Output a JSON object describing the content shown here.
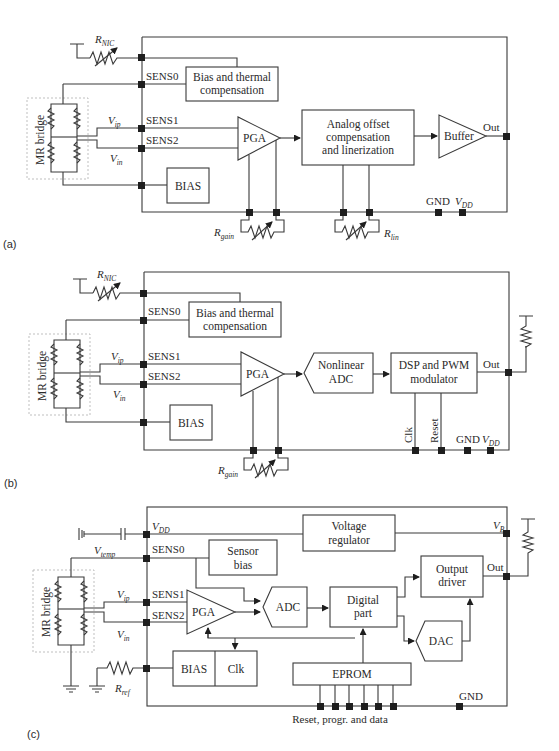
{
  "panels": {
    "a": {
      "caption": "(a)",
      "pins": {
        "sens0": "SENS0",
        "sens1": "SENS1",
        "sens2": "SENS2",
        "gnd": "GND",
        "vdd_main": "V",
        "vdd_sub": "DD",
        "out": "Out"
      },
      "labels": {
        "rnic_main": "R",
        "rnic_sub": "NIC",
        "vip_main": "V",
        "vip_sub": "ip",
        "vin_main": "V",
        "vin_sub": "in",
        "rgain_main": "R",
        "rgain_sub": "gain",
        "rlin_main": "R",
        "rlin_sub": "lin"
      },
      "blocks": {
        "mr_bridge": "MR bridge",
        "bias_thermal_1": "Bias and thermal",
        "bias_thermal_2": "compensation",
        "pga": "PGA",
        "analog_1": "Analog offset",
        "analog_2": "compensation",
        "analog_3": "and linerization",
        "buffer": "Buffer",
        "bias": "BIAS"
      }
    },
    "b": {
      "caption": "(b)",
      "pins": {
        "sens0": "SENS0",
        "sens1": "SENS1",
        "sens2": "SENS2",
        "gnd": "GND",
        "vdd_main": "V",
        "vdd_sub": "DD",
        "out": "Out",
        "clk": "Clk",
        "reset": "Reset"
      },
      "labels": {
        "rnic_main": "R",
        "rnic_sub": "NIC",
        "vip_main": "V",
        "vip_sub": "ip",
        "vin_main": "V",
        "vin_sub": "in",
        "rgain_main": "R",
        "rgain_sub": "gain"
      },
      "blocks": {
        "mr_bridge": "MR bridge",
        "bias_thermal_1": "Bias and thermal",
        "bias_thermal_2": "compensation",
        "pga": "PGA",
        "adc_1": "Nonlinear",
        "adc_2": "ADC",
        "dsp_1": "DSP and PWM",
        "dsp_2": "modulator",
        "bias": "BIAS"
      }
    },
    "c": {
      "caption": "(c)",
      "pins": {
        "vdd_main": "V",
        "vdd_sub": "DD",
        "sens0": "SENS0",
        "sens1": "SENS1",
        "sens2": "SENS2",
        "gnd": "GND",
        "vb_main": "V",
        "vb_sub": "B",
        "out": "Out",
        "prog": "Reset, progr. and data"
      },
      "labels": {
        "vtemp_main": "V",
        "vtemp_sub": "temp",
        "vip_main": "V",
        "vip_sub": "ip",
        "vin_main": "V",
        "vin_sub": "in",
        "rref_main": "R",
        "rref_sub": "ref"
      },
      "blocks": {
        "mr_bridge": "MR bridge",
        "voltage_reg_1": "Voltage",
        "voltage_reg_2": "regulator",
        "sensor_bias_1": "Sensor",
        "sensor_bias_2": "bias",
        "pga": "PGA",
        "adc": "ADC",
        "digital_1": "Digital",
        "digital_2": "part",
        "output_driver_1": "Output",
        "output_driver_2": "driver",
        "dac": "DAC",
        "bias": "BIAS",
        "clk": "Clk",
        "eprom": "EPROM"
      }
    }
  }
}
